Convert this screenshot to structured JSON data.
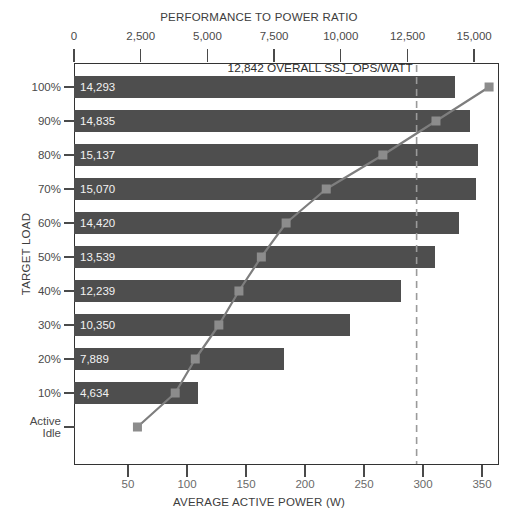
{
  "chart_data": {
    "type": "bar",
    "title": "PERFORMANCE TO POWER RATIO",
    "xlabel_bottom": "AVERAGE ACTIVE POWER (W)",
    "ylabel": "TARGET LOAD",
    "grid": false,
    "legend": "none",
    "categories": [
      "100%",
      "90%",
      "80%",
      "70%",
      "60%",
      "50%",
      "40%",
      "30%",
      "20%",
      "10%",
      "Active Idle"
    ],
    "values": [
      14293,
      14835,
      15137,
      15070,
      14420,
      13539,
      12239,
      10350,
      7889,
      4634,
      null
    ],
    "value_labels": [
      "14,293",
      "14,835",
      "15,137",
      "15,070",
      "14,420",
      "13,539",
      "12,239",
      "10,350",
      "7,889",
      "4,634",
      ""
    ],
    "top_axis": {
      "label": "PERFORMANCE TO POWER RATIO",
      "ticks": [
        0,
        2500,
        5000,
        7500,
        10000,
        12500,
        15000
      ],
      "tick_labels": [
        "0",
        "2,500",
        "5,000",
        "7,500",
        "10,000",
        "12,500",
        "15,000"
      ],
      "range": [
        0,
        15930
      ]
    },
    "bottom_axis": {
      "label": "AVERAGE ACTIVE POWER (W)",
      "ticks": [
        50,
        100,
        150,
        200,
        250,
        300,
        350
      ],
      "tick_labels": [
        "50",
        "100",
        "150",
        "200",
        "250",
        "300",
        "350"
      ],
      "range": [
        -4,
        356
      ]
    },
    "series": [
      {
        "name": "Average Active Power",
        "type": "line",
        "marker": "square",
        "x": [
          356,
          311,
          266,
          218,
          184,
          163,
          144,
          127,
          107,
          90,
          58
        ],
        "categories": [
          "100%",
          "90%",
          "80%",
          "70%",
          "60%",
          "50%",
          "40%",
          "30%",
          "20%",
          "10%",
          "Active Idle"
        ]
      }
    ],
    "annotations": [
      {
        "text": "12,842 OVERALL SSJ_OPS/WATT",
        "value": 12842,
        "type": "vertical-dashed-line"
      }
    ],
    "colors": {
      "bar": "#4e4e4e",
      "line": "#7e7e7e",
      "marker": "#8c8c8c",
      "axis": "#3a3a3a",
      "text": "#3d3d3d",
      "bar_value_text": "#f2f2f2",
      "dashed_line": "#9a9a9a",
      "background": "#ffffff"
    }
  }
}
